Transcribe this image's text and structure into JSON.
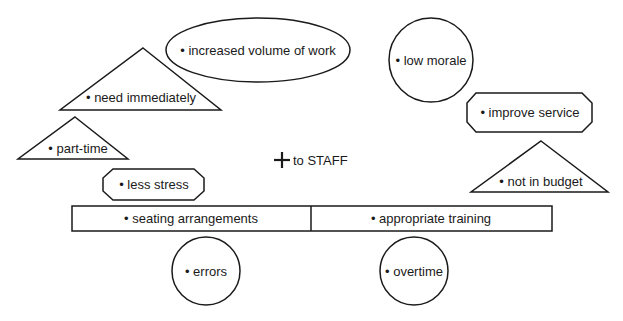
{
  "diagram": {
    "center": {
      "symbol": "+",
      "label": "to STAFF"
    },
    "items": [
      {
        "id": "increased-volume",
        "shape": "ellipse",
        "label": "• increased volume of work"
      },
      {
        "id": "low-morale",
        "shape": "circle",
        "label": "• low morale"
      },
      {
        "id": "need-immediately",
        "shape": "triangle",
        "label": "• need immediately"
      },
      {
        "id": "part-time",
        "shape": "triangle",
        "label": "• part-time"
      },
      {
        "id": "improve-service",
        "shape": "octagon",
        "label": "• improve service"
      },
      {
        "id": "not-in-budget",
        "shape": "triangle",
        "label": "• not in budget"
      },
      {
        "id": "less-stress",
        "shape": "octagon",
        "label": "• less stress"
      },
      {
        "id": "seating-arrangements",
        "shape": "rectangle",
        "label": "• seating arrangements"
      },
      {
        "id": "appropriate-training",
        "shape": "rectangle",
        "label": "• appropriate training"
      },
      {
        "id": "errors",
        "shape": "circle",
        "label": "• errors"
      },
      {
        "id": "overtime",
        "shape": "circle",
        "label": "• overtime"
      }
    ]
  },
  "colors": {
    "stroke": "#1a1a1a",
    "fill": "#ffffff",
    "background": "#ffffff"
  }
}
